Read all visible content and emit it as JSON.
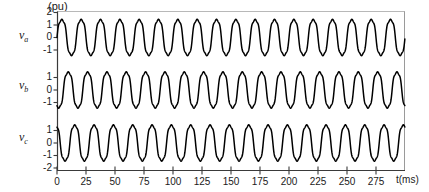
{
  "figure": {
    "unit_label": "(pu)",
    "xaxis_title": "t(ms)",
    "background_color": "#ffffff",
    "trace_color": "#000000",
    "axis_color": "#3a3a3a"
  },
  "chart_data": {
    "type": "line",
    "title": "",
    "subtitle": "",
    "xlabel": "t(ms)",
    "ylabel": "(pu)",
    "grid": false,
    "legend_position": "none",
    "xlim": [
      0,
      300
    ],
    "xticks": [
      0,
      25,
      50,
      75,
      100,
      125,
      150,
      175,
      200,
      225,
      250,
      275
    ],
    "xtick_labels": [
      "0",
      "25",
      "50",
      "75",
      "100",
      "125",
      "150",
      "175",
      "200",
      "225",
      "250",
      "275"
    ],
    "panels": [
      {
        "name": "v_a",
        "label_main": "v",
        "label_sub": "a",
        "ylim": [
          -2,
          2
        ],
        "yticks": [
          2,
          1,
          0,
          -1
        ],
        "ytick_labels": [
          "2",
          "1",
          "0",
          "-1"
        ],
        "series": {
          "name": "v_a",
          "amplitude": 1.55,
          "frequency_hz": 60,
          "phase_deg": 0,
          "waveform": "distorted-sine",
          "harmonic3_amplitude": 0.12,
          "harmonic5_amplitude": 0.06
        }
      },
      {
        "name": "v_b",
        "label_main": "v",
        "label_sub": "b",
        "ylim": [
          -2,
          2
        ],
        "yticks": [
          1,
          0,
          -1
        ],
        "ytick_labels": [
          "1",
          "0",
          "-1"
        ],
        "series": {
          "name": "v_b",
          "amplitude": 1.55,
          "frequency_hz": 60,
          "phase_deg": -120,
          "waveform": "distorted-sine",
          "harmonic3_amplitude": 0.12,
          "harmonic5_amplitude": 0.06
        }
      },
      {
        "name": "v_c",
        "label_main": "v",
        "label_sub": "c",
        "ylim": [
          -2,
          2
        ],
        "yticks": [
          1,
          0,
          -1,
          -2
        ],
        "ytick_labels": [
          "1",
          "0",
          "-1",
          "-2"
        ],
        "series": {
          "name": "v_c",
          "amplitude": 1.55,
          "frequency_hz": 60,
          "phase_deg": 120,
          "waveform": "distorted-sine",
          "harmonic3_amplitude": 0.12,
          "harmonic5_amplitude": 0.06
        }
      }
    ]
  }
}
